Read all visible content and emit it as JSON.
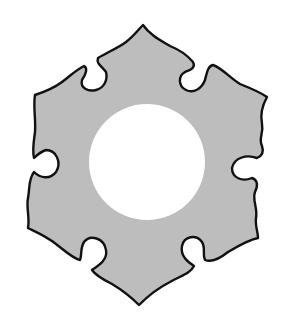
{
  "figure": {
    "title": "Hexagonal crest with scalloped notches",
    "fill_color": "#bdbdbd",
    "stroke_color": "#111111",
    "background_color": "#ffffff",
    "center_hole_color": "#ffffff",
    "notch_count": 6,
    "point_count": 6
  }
}
